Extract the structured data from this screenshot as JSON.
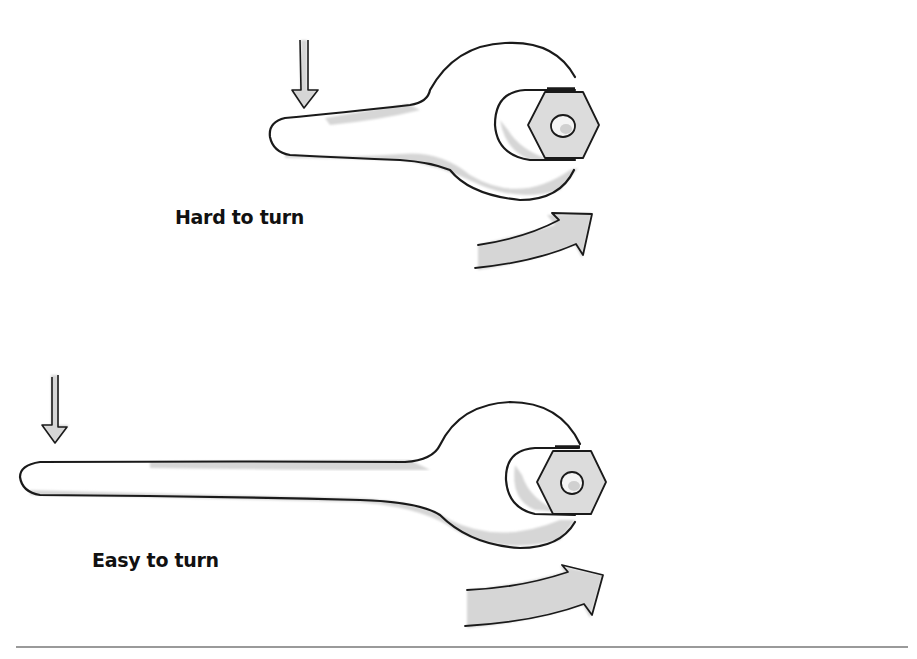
{
  "figure": {
    "panels": [
      {
        "id": "short-wrench",
        "label": "Hard to turn",
        "handle": "short"
      },
      {
        "id": "long-wrench",
        "label": "Easy to turn",
        "handle": "long"
      }
    ],
    "colors": {
      "outline": "#1a1a1a",
      "shade": "#d6d6d6",
      "background": "#ffffff"
    },
    "icons": [
      "down-arrow-icon",
      "wrench-icon",
      "nut-icon",
      "rotation-arrow-icon"
    ]
  }
}
